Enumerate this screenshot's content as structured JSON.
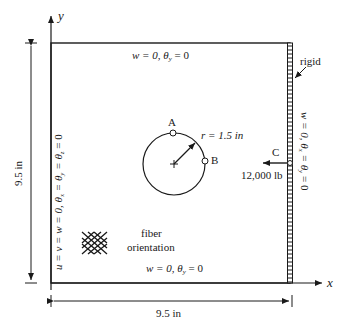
{
  "diagram": {
    "axes": {
      "x_label": "x",
      "y_label": "y"
    },
    "plate": {
      "width_dimension": "9.5 in",
      "height_dimension": "9.5 in"
    },
    "boundary_conditions": {
      "top": {
        "w": "w = 0, ",
        "theta": "θ",
        "sub": "y",
        "rest": " = 0"
      },
      "bottom": {
        "w": "w = 0, ",
        "theta": "θ",
        "sub": "y",
        "rest": " = 0"
      },
      "left": {
        "text": "u = v = w = 0, θ",
        "sub1": "x",
        "mid1": " = θ",
        "sub2": "y",
        "mid2": " = θ",
        "sub3": "z",
        "rest": " = 0"
      },
      "right": {
        "text": "w = 0, θ",
        "sub1": "x",
        "mid": " = θ",
        "sub2": "y",
        "rest": " = 0"
      }
    },
    "rigid_label": "rigid",
    "hole": {
      "radius_label": "r = 1.5 in",
      "point_a": "A",
      "point_b": "B"
    },
    "load": {
      "point": "C",
      "magnitude": "12,000 lb"
    },
    "fiber": {
      "line1": "fiber",
      "line2": "orientation"
    },
    "colors": {
      "line": "#1a1a1a",
      "background": "#ffffff"
    }
  }
}
